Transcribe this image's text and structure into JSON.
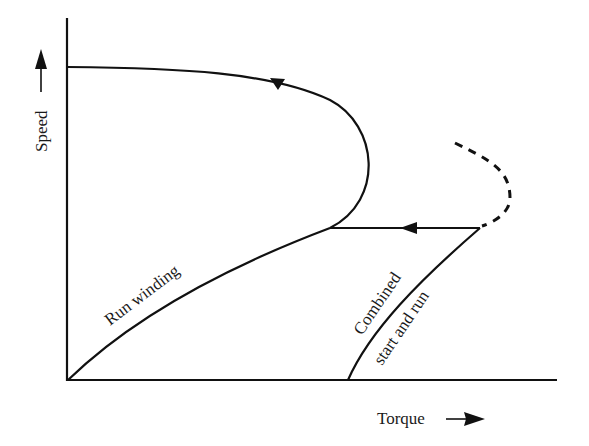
{
  "diagram": {
    "type": "torque-speed characteristic",
    "axes": {
      "x_label": "Torque",
      "y_label": "Speed"
    },
    "curves": [
      {
        "label": "Run winding",
        "style": "solid"
      },
      {
        "label_line1": "Combined",
        "label_line2": "start and run",
        "style": "solid"
      },
      {
        "label": "",
        "style": "dashed"
      }
    ],
    "colors": {
      "line": "#111111",
      "background": "#ffffff"
    }
  }
}
